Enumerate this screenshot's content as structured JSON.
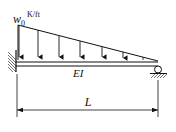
{
  "diagram": {
    "load_label": "w",
    "load_subscript": "0",
    "load_units": "K/ft",
    "beam_label": "EI",
    "span_label": "L",
    "load_type": "linearly-varying distributed load",
    "left_support": "fixed",
    "right_support": "roller",
    "colors": {
      "line": "#111111",
      "background": "#ffffff"
    }
  }
}
